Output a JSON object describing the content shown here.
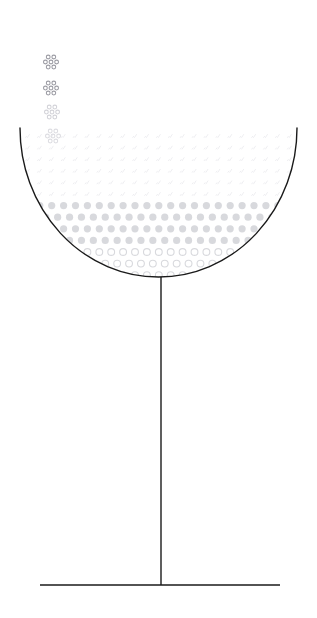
{
  "scene": {
    "title": "Glass with rising bubbles",
    "subject": "coupe-glass",
    "background_color": "#ffffff",
    "canvas": {
      "width": 317,
      "height": 618
    }
  },
  "glass": {
    "name": "coupe-glass",
    "stroke_color": "#1a1a1a",
    "stroke_width": 1.4,
    "fill": "none",
    "bowl": {
      "label": "glass-bowl",
      "rim_left_x": 20,
      "rim_right_x": 297,
      "rim_y": 128,
      "bottom_y": 277,
      "center_x": 158.5,
      "radius_x": 138.5,
      "radius_y": 149
    },
    "stem": {
      "label": "glass-stem",
      "x": 161,
      "top_y": 277,
      "bottom_y": 585
    },
    "base": {
      "label": "glass-base",
      "left_x": 40,
      "right_x": 280,
      "y": 585
    }
  },
  "bubble_field": {
    "label": "bubbles-in-liquid",
    "columns": 24,
    "rows": 13,
    "col_spacing": 11.9,
    "row_spacing": 11.6,
    "origin_x": 16,
    "origin_y": 136,
    "zones": [
      {
        "name": "sparse-faint-zone",
        "row_start": 0,
        "row_end": 5,
        "style": "tick",
        "color": "#eeeef1",
        "radius": 1.5,
        "description": "very faint tiny comma-like marks"
      },
      {
        "name": "dense-filled-zone",
        "row_start": 6,
        "row_end": 9,
        "style": "filled",
        "color": "#d8d9dd",
        "radius": 3.6,
        "description": "solid pale grey dots"
      },
      {
        "name": "ring-zone",
        "row_start": 10,
        "row_end": 12,
        "style": "ring",
        "color": "#d8d9dd",
        "radius": 3.4,
        "stroke_width": 1.1,
        "description": "hollow outlined circles near the bottom of the bowl"
      }
    ]
  },
  "bubble_clusters": {
    "label": "rising-bubble-clusters",
    "pattern": "hexagonal 2-3-2",
    "dot_radius": 1.9,
    "dot_spacing_x": 5.6,
    "dot_spacing_y": 5.0,
    "items": [
      {
        "name": "cluster-top",
        "cx": 51,
        "cy": 62,
        "color": "#9b9ba3",
        "opacity": 1.0
      },
      {
        "name": "cluster-upper-mid",
        "cx": 51,
        "cy": 88,
        "color": "#9b9ba3",
        "opacity": 1.0
      },
      {
        "name": "cluster-lower-mid",
        "cx": 52,
        "cy": 112,
        "color": "#d2d2d8",
        "opacity": 1.0
      },
      {
        "name": "cluster-at-rim",
        "cx": 53,
        "cy": 136,
        "color": "#dcdce1",
        "opacity": 1.0
      }
    ]
  },
  "palette": {
    "line": "#1a1a1a",
    "bubble_dark": "#9b9ba3",
    "bubble_mid": "#d2d2d8",
    "bubble_light": "#d8d9dd",
    "bubble_faint": "#eeeef1",
    "background": "#ffffff"
  }
}
